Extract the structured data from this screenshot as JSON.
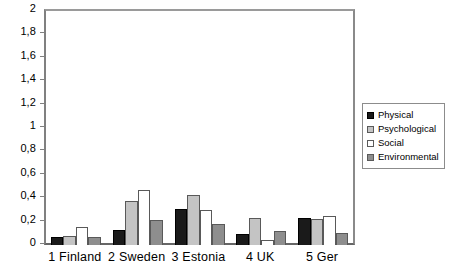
{
  "chart_data": {
    "type": "bar",
    "title": "",
    "subtitle": "",
    "xlabel": "",
    "ylabel": "",
    "ylim": [
      0,
      2
    ],
    "grid": false,
    "legend_position": "right",
    "categories": [
      "1 Finland",
      "2 Sweden",
      "3 Estonia",
      "4 UK",
      "5 Ger"
    ],
    "y_ticks": [
      {
        "value": 2,
        "label": "2"
      },
      {
        "value": 1.8,
        "label": "1,8"
      },
      {
        "value": 1.6,
        "label": "1,6"
      },
      {
        "value": 1.4,
        "label": "1,4"
      },
      {
        "value": 1.2,
        "label": "1,2"
      },
      {
        "value": 1,
        "label": "1"
      },
      {
        "value": 0.8,
        "label": "0,8"
      },
      {
        "value": 0.6,
        "label": "0,6"
      },
      {
        "value": 0.4,
        "label": "0,4"
      },
      {
        "value": 0.2,
        "label": "0,2"
      },
      {
        "value": 0,
        "label": "0"
      }
    ],
    "series": [
      {
        "name": "Physical",
        "color": "#1a1a1a",
        "values": [
          0.07,
          0.13,
          0.31,
          0.09,
          0.23
        ]
      },
      {
        "name": "Psychological",
        "color": "#c4c4c4",
        "values": [
          0.08,
          0.38,
          0.43,
          0.23,
          0.22
        ]
      },
      {
        "name": "Social",
        "color": "#ffffff",
        "values": [
          0.15,
          0.47,
          0.3,
          0.04,
          0.25
        ]
      },
      {
        "name": "Environmental",
        "color": "#8e8e8e",
        "values": [
          0.07,
          0.21,
          0.18,
          0.12,
          0.1
        ]
      }
    ]
  }
}
